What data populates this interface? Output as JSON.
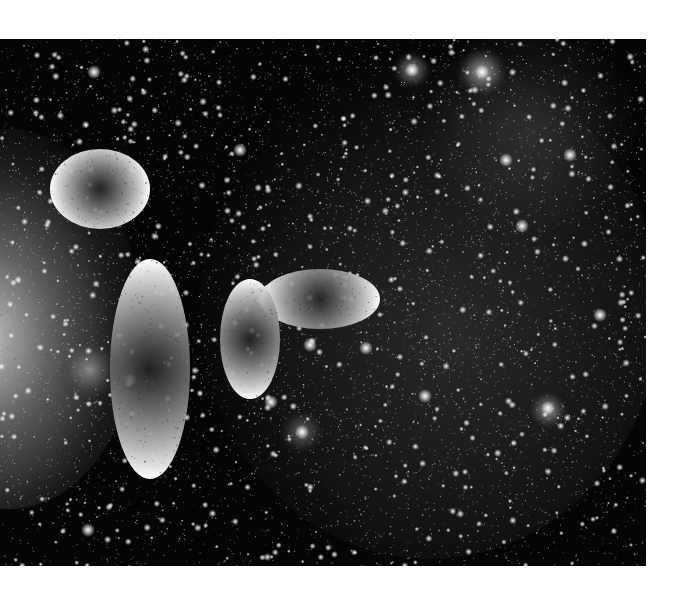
{
  "image": {
    "subject": "Milky Way star field with nebulae (grayscale)",
    "background_color": "#ffffff",
    "frame": {
      "x": 0,
      "y": 39,
      "width": 646,
      "height": 527
    },
    "features": [
      {
        "name": "bright-nebula-left",
        "cx": 20,
        "cy": 300,
        "rx": 110,
        "ry": 170,
        "intensity": 0.85
      },
      {
        "name": "diffuse-milky-way-band",
        "cx": 440,
        "cy": 300,
        "rx": 220,
        "ry": 230,
        "intensity": 0.28
      },
      {
        "name": "ring-nebula-top-a",
        "cx": 412,
        "cy": 70,
        "r": 12,
        "intensity": 0.6
      },
      {
        "name": "ring-nebula-top-b",
        "cx": 482,
        "cy": 72,
        "r": 16,
        "intensity": 0.7
      },
      {
        "name": "nebula-lower-right",
        "cx": 548,
        "cy": 410,
        "r": 12,
        "intensity": 0.6
      },
      {
        "name": "nebula-lower-center",
        "cx": 302,
        "cy": 432,
        "r": 14,
        "intensity": 0.4
      },
      {
        "name": "nebula-left-small",
        "cx": 90,
        "cy": 370,
        "r": 18,
        "intensity": 0.45
      }
    ],
    "bright_stars": [
      [
        271,
        402
      ],
      [
        425,
        396
      ],
      [
        522,
        226
      ],
      [
        506,
        160
      ],
      [
        88,
        530
      ],
      [
        94,
        72
      ],
      [
        310,
        345
      ],
      [
        366,
        348
      ],
      [
        600,
        315
      ],
      [
        570,
        155
      ],
      [
        240,
        150
      ],
      [
        130,
        380
      ],
      [
        302,
        432
      ],
      [
        548,
        408
      ],
      [
        482,
        72
      ],
      [
        412,
        70
      ]
    ]
  }
}
